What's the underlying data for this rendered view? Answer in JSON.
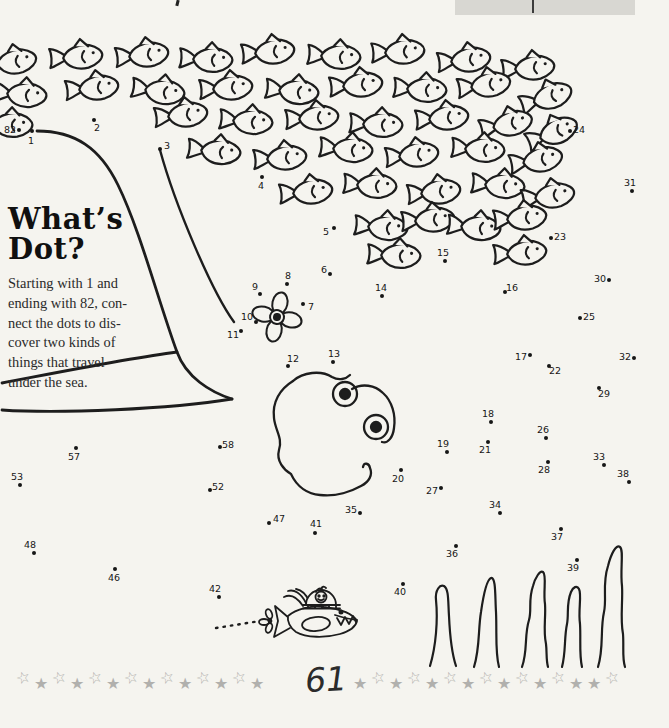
{
  "page": {
    "title": [
      "What’s",
      "Dot?"
    ],
    "instructions": [
      "Starting with 1 and",
      "ending with 82, con-",
      "nect the dots to dis-",
      "cover two kinds of",
      "things that travel",
      "under the sea."
    ],
    "page_number": "61"
  },
  "puzzle": {
    "dots": [
      {
        "n": "1",
        "x": 32,
        "y": 131,
        "lx": 31,
        "ly": 141
      },
      {
        "n": "2",
        "x": 94,
        "y": 120,
        "lx": 97,
        "ly": 128
      },
      {
        "n": "3",
        "x": 160,
        "y": 149,
        "lx": 167,
        "ly": 146
      },
      {
        "n": "4",
        "x": 262,
        "y": 177,
        "lx": 261,
        "ly": 186
      },
      {
        "n": "5",
        "x": 334,
        "y": 228,
        "lx": 326,
        "ly": 232
      },
      {
        "n": "6",
        "x": 330,
        "y": 274,
        "lx": 324,
        "ly": 270
      },
      {
        "n": "7",
        "x": 303,
        "y": 304,
        "lx": 311,
        "ly": 307
      },
      {
        "n": "8",
        "x": 287,
        "y": 284,
        "lx": 288,
        "ly": 276
      },
      {
        "n": "9",
        "x": 260,
        "y": 294,
        "lx": 255,
        "ly": 287
      },
      {
        "n": "10",
        "x": 256,
        "y": 322,
        "lx": 247,
        "ly": 317
      },
      {
        "n": "11",
        "x": 241,
        "y": 331,
        "lx": 233,
        "ly": 335
      },
      {
        "n": "12",
        "x": 288,
        "y": 366,
        "lx": 293,
        "ly": 359
      },
      {
        "n": "13",
        "x": 333,
        "y": 362,
        "lx": 334,
        "ly": 354
      },
      {
        "n": "14",
        "x": 382,
        "y": 296,
        "lx": 381,
        "ly": 288
      },
      {
        "n": "15",
        "x": 445,
        "y": 261,
        "lx": 443,
        "ly": 253
      },
      {
        "n": "16",
        "x": 505,
        "y": 292,
        "lx": 512,
        "ly": 288
      },
      {
        "n": "17",
        "x": 530,
        "y": 355,
        "lx": 521,
        "ly": 357
      },
      {
        "n": "18",
        "x": 491,
        "y": 422,
        "lx": 488,
        "ly": 414
      },
      {
        "n": "19",
        "x": 447,
        "y": 452,
        "lx": 443,
        "ly": 444
      },
      {
        "n": "20",
        "x": 401,
        "y": 470,
        "lx": 398,
        "ly": 479
      },
      {
        "n": "21",
        "x": 488,
        "y": 442,
        "lx": 485,
        "ly": 450
      },
      {
        "n": "22",
        "x": 549,
        "y": 366,
        "lx": 555,
        "ly": 371
      },
      {
        "n": "23",
        "x": 551,
        "y": 238,
        "lx": 560,
        "ly": 237
      },
      {
        "n": "24",
        "x": 570,
        "y": 131,
        "lx": 579,
        "ly": 130
      },
      {
        "n": "25",
        "x": 580,
        "y": 318,
        "lx": 589,
        "ly": 317
      },
      {
        "n": "26",
        "x": 546,
        "y": 438,
        "lx": 543,
        "ly": 430
      },
      {
        "n": "27",
        "x": 441,
        "y": 488,
        "lx": 432,
        "ly": 491
      },
      {
        "n": "28",
        "x": 548,
        "y": 462,
        "lx": 544,
        "ly": 470
      },
      {
        "n": "29",
        "x": 599,
        "y": 388,
        "lx": 604,
        "ly": 394
      },
      {
        "n": "30",
        "x": 609,
        "y": 280,
        "lx": 600,
        "ly": 279
      },
      {
        "n": "31",
        "x": 632,
        "y": 191,
        "lx": 630,
        "ly": 183
      },
      {
        "n": "32",
        "x": 634,
        "y": 358,
        "lx": 625,
        "ly": 357
      },
      {
        "n": "33",
        "x": 604,
        "y": 465,
        "lx": 599,
        "ly": 457
      },
      {
        "n": "34",
        "x": 500,
        "y": 513,
        "lx": 495,
        "ly": 505
      },
      {
        "n": "35",
        "x": 360,
        "y": 513,
        "lx": 351,
        "ly": 510
      },
      {
        "n": "36",
        "x": 456,
        "y": 546,
        "lx": 452,
        "ly": 554
      },
      {
        "n": "37",
        "x": 561,
        "y": 529,
        "lx": 557,
        "ly": 537
      },
      {
        "n": "38",
        "x": 629,
        "y": 482,
        "lx": 623,
        "ly": 474
      },
      {
        "n": "39",
        "x": 577,
        "y": 560,
        "lx": 573,
        "ly": 568
      },
      {
        "n": "40",
        "x": 403,
        "y": 584,
        "lx": 400,
        "ly": 592
      },
      {
        "n": "41",
        "x": 315,
        "y": 533,
        "lx": 316,
        "ly": 524
      },
      {
        "n": "42",
        "x": 219,
        "y": 597,
        "lx": 215,
        "ly": 589
      },
      {
        "n": "46",
        "x": 115,
        "y": 569,
        "lx": 114,
        "ly": 578
      },
      {
        "n": "47",
        "x": 269,
        "y": 523,
        "lx": 279,
        "ly": 519
      },
      {
        "n": "48",
        "x": 34,
        "y": 553,
        "lx": 30,
        "ly": 545
      },
      {
        "n": "52",
        "x": 210,
        "y": 490,
        "lx": 218,
        "ly": 487
      },
      {
        "n": "53",
        "x": 20,
        "y": 485,
        "lx": 17,
        "ly": 477
      },
      {
        "n": "57",
        "x": 76,
        "y": 448,
        "lx": 74,
        "ly": 457
      },
      {
        "n": "58",
        "x": 220,
        "y": 447,
        "lx": 228,
        "ly": 445
      },
      {
        "n": "82",
        "x": 19,
        "y": 130,
        "lx": 10,
        "ly": 130
      }
    ]
  },
  "decorations": {
    "stars_left": [
      "outline",
      "filled",
      "outline",
      "filled",
      "outline",
      "filled",
      "outline",
      "filled",
      "outline",
      "filled",
      "outline",
      "filled",
      "outline",
      "filled"
    ],
    "stars_right": [
      "filled",
      "outline",
      "filled",
      "outline",
      "filled",
      "outline",
      "filled",
      "outline",
      "filled",
      "outline",
      "filled",
      "outline",
      "filled",
      "filled",
      "outline"
    ],
    "star_glyphs": {
      "outline": "☆",
      "filled": "★"
    },
    "fish_positions": [
      [
        14,
        62,
        -8
      ],
      [
        80,
        57,
        -4
      ],
      [
        146,
        55,
        -6
      ],
      [
        210,
        60,
        3
      ],
      [
        272,
        52,
        -5
      ],
      [
        338,
        57,
        4
      ],
      [
        402,
        52,
        -3
      ],
      [
        468,
        60,
        -6
      ],
      [
        532,
        68,
        -4
      ],
      [
        24,
        95,
        5
      ],
      [
        96,
        88,
        -6
      ],
      [
        162,
        92,
        8
      ],
      [
        230,
        88,
        -4
      ],
      [
        296,
        92,
        6
      ],
      [
        360,
        85,
        -5
      ],
      [
        424,
        90,
        4
      ],
      [
        488,
        85,
        -8
      ],
      [
        550,
        97,
        -18
      ],
      [
        10,
        125,
        3
      ],
      [
        185,
        115,
        -6
      ],
      [
        250,
        122,
        5
      ],
      [
        316,
        118,
        -4
      ],
      [
        380,
        125,
        3
      ],
      [
        446,
        118,
        -5
      ],
      [
        510,
        124,
        -12
      ],
      [
        556,
        132,
        -22
      ],
      [
        218,
        152,
        6
      ],
      [
        284,
        158,
        -4
      ],
      [
        350,
        150,
        5
      ],
      [
        416,
        155,
        -6
      ],
      [
        482,
        150,
        4
      ],
      [
        540,
        160,
        -10
      ],
      [
        310,
        192,
        -5
      ],
      [
        374,
        186,
        4
      ],
      [
        438,
        192,
        -6
      ],
      [
        502,
        186,
        5
      ],
      [
        552,
        196,
        -8
      ],
      [
        385,
        228,
        5
      ],
      [
        432,
        220,
        -4
      ],
      [
        478,
        228,
        6
      ],
      [
        524,
        218,
        -5
      ],
      [
        398,
        256,
        3
      ],
      [
        524,
        253,
        -4
      ]
    ]
  },
  "colors": {
    "ink": "#1d1d1d",
    "paper": "#f5f4ef",
    "star_gray": "#b1b0ad",
    "header_box_gray": "#d8d7d2"
  }
}
